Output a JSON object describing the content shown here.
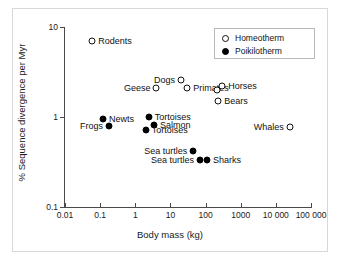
{
  "chart_data": {
    "type": "scatter",
    "title": "",
    "xlabel": "Body mass (kg)",
    "ylabel": "% Sequence divergence per Myr",
    "xscale": "log",
    "yscale": "log",
    "xlim": [
      0.01,
      100000
    ],
    "ylim": [
      0.1,
      10
    ],
    "grid": false,
    "legend_position": "top-right",
    "xticks": [
      "0.01",
      "0.1",
      "1",
      "10",
      "100",
      "1000",
      "10 000",
      "100 000"
    ],
    "xtick_values": [
      0.01,
      0.1,
      1,
      10,
      100,
      1000,
      10000,
      100000
    ],
    "yticks": [
      "10",
      "1",
      "0.1"
    ],
    "ytick_values": [
      10,
      1,
      0.1
    ],
    "legend": [
      {
        "label": "Homeotherm",
        "marker": "open-circle"
      },
      {
        "label": "Poikilotherm",
        "marker": "filled-circle"
      }
    ],
    "series": [
      {
        "name": "Homeotherm",
        "marker": "open-circle",
        "points": [
          {
            "label": "Rodents",
            "x": 0.06,
            "y": 7.0,
            "label_side": "right"
          },
          {
            "label": "Geese",
            "x": 4.0,
            "y": 2.1,
            "label_side": "left"
          },
          {
            "label": "Dogs",
            "x": 20.0,
            "y": 2.6,
            "label_side": "left"
          },
          {
            "label": "Primates",
            "x": 30.0,
            "y": 2.1,
            "label_side": "right"
          },
          {
            "label": "Horses",
            "x": 300.0,
            "y": 2.2,
            "label_side": "right"
          },
          {
            "label": "",
            "x": 210.0,
            "y": 2.0,
            "label_side": "right"
          },
          {
            "label": "Bears",
            "x": 230.0,
            "y": 1.5,
            "label_side": "right"
          },
          {
            "label": "Whales",
            "x": 25000.0,
            "y": 0.78,
            "label_side": "left"
          }
        ]
      },
      {
        "name": "Poikilotherm",
        "marker": "filled-circle",
        "points": [
          {
            "label": "Newts",
            "x": 0.12,
            "y": 0.95,
            "label_side": "right"
          },
          {
            "label": "Frogs",
            "x": 0.18,
            "y": 0.8,
            "label_side": "left"
          },
          {
            "label": "Tortoises",
            "x": 2.4,
            "y": 1.0,
            "label_side": "right"
          },
          {
            "label": "Salmon",
            "x": 3.4,
            "y": 0.82,
            "label_side": "right"
          },
          {
            "label": "Tortoises",
            "x": 2.0,
            "y": 0.71,
            "label_side": "right"
          },
          {
            "label": "Sea turtles",
            "x": 45.0,
            "y": 0.42,
            "label_side": "left"
          },
          {
            "label": "Sea turtles",
            "x": 70.0,
            "y": 0.33,
            "label_side": "left"
          },
          {
            "label": "Sharks",
            "x": 110.0,
            "y": 0.33,
            "label_side": "right"
          }
        ]
      }
    ]
  }
}
